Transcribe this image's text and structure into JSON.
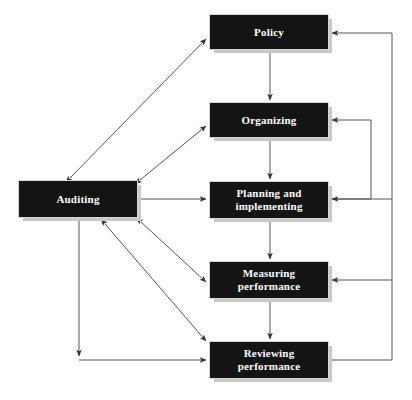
{
  "diagram": {
    "type": "flow-diagram",
    "canvas": {
      "width": 412,
      "height": 400
    },
    "colors": {
      "node_fill": "#141414",
      "node_text": "#ffffff",
      "node_shadow": "#c9c9c9",
      "connector": "#555555",
      "background": "#ffffff"
    },
    "nodes": [
      {
        "id": "policy",
        "label": "Policy",
        "x": 209,
        "y": 14,
        "w": 120,
        "h": 36
      },
      {
        "id": "organizing",
        "label": "Organizing",
        "x": 209,
        "y": 102,
        "w": 120,
        "h": 36
      },
      {
        "id": "planning",
        "label": "Planning and\nimplementing",
        "x": 209,
        "y": 181,
        "w": 120,
        "h": 38
      },
      {
        "id": "measuring",
        "label": "Measuring\nperformance",
        "x": 209,
        "y": 261,
        "w": 120,
        "h": 38
      },
      {
        "id": "reviewing",
        "label": "Reviewing\nperformance",
        "x": 209,
        "y": 341,
        "w": 120,
        "h": 38
      },
      {
        "id": "auditing",
        "label": "Auditing",
        "x": 18,
        "y": 180,
        "w": 120,
        "h": 38
      }
    ],
    "connectors": [
      {
        "id": "policy-to-organizing",
        "from": "policy",
        "to": "organizing",
        "style": "single-arrow",
        "direction": "down"
      },
      {
        "id": "organizing-to-planning",
        "from": "organizing",
        "to": "planning",
        "style": "single-arrow",
        "direction": "down"
      },
      {
        "id": "planning-to-measuring",
        "from": "planning",
        "to": "measuring",
        "style": "single-arrow",
        "direction": "down"
      },
      {
        "id": "measuring-to-reviewing",
        "from": "measuring",
        "to": "reviewing",
        "style": "single-arrow",
        "direction": "down"
      },
      {
        "id": "auditing-policy",
        "from": "auditing",
        "to": "policy",
        "style": "double-arrow",
        "direction": "diagonal-up-right"
      },
      {
        "id": "auditing-organizing",
        "from": "auditing",
        "to": "organizing",
        "style": "double-arrow",
        "direction": "diagonal-up-right"
      },
      {
        "id": "auditing-planning",
        "from": "auditing",
        "to": "planning",
        "style": "double-arrow",
        "direction": "horizontal"
      },
      {
        "id": "auditing-measuring",
        "from": "auditing",
        "to": "measuring",
        "style": "double-arrow",
        "direction": "diagonal-down-right"
      },
      {
        "id": "auditing-reviewing",
        "from": "auditing",
        "to": "reviewing",
        "style": "double-arrow",
        "direction": "diagonal-down-right"
      },
      {
        "id": "auditing-down-to-reviewing",
        "from": "auditing",
        "to": "reviewing",
        "style": "elbow-double-arrow",
        "direction": "down-then-right"
      },
      {
        "id": "reviewing-feedback-policy",
        "from": "reviewing",
        "to": "policy",
        "style": "feedback-elbow",
        "direction": "right-up-left"
      },
      {
        "id": "reviewing-feedback-organizing",
        "from": "reviewing",
        "to": "organizing",
        "style": "feedback-elbow",
        "direction": "right-up-left"
      },
      {
        "id": "reviewing-feedback-planning",
        "from": "reviewing",
        "to": "planning",
        "style": "feedback-elbow",
        "direction": "right-up-left"
      },
      {
        "id": "reviewing-feedback-measuring",
        "from": "reviewing",
        "to": "measuring",
        "style": "feedback-elbow",
        "direction": "right-up-left"
      }
    ]
  }
}
